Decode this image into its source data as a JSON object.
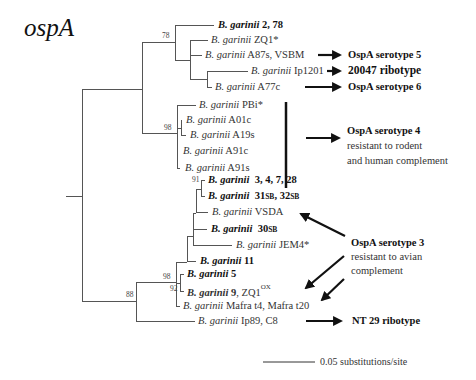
{
  "title": "ospA",
  "taxa": [
    {
      "genus": "B. garinii",
      "strain": "2, 78",
      "bold": true
    },
    {
      "genus": "B. garinii",
      "strain": "ZQ1*",
      "bold": false
    },
    {
      "genus": "B. garinii",
      "strain": "A87s, VSBM",
      "bold": false
    },
    {
      "genus": "B. garinii",
      "strain": "Ip1201",
      "bold": false
    },
    {
      "genus": "B. garinii",
      "strain": "A77c",
      "bold": false
    },
    {
      "genus": "B. garinii",
      "strain": "PBi*",
      "bold": false
    },
    {
      "genus": "B. garinii",
      "strain": "A01c",
      "bold": false
    },
    {
      "genus": "B. garinii",
      "strain": "A19s",
      "bold": false
    },
    {
      "genus": "B. garinii",
      "strain": "A91c",
      "bold": false
    },
    {
      "genus": "B. garinii",
      "strain": "A91s",
      "bold": false
    },
    {
      "genus": "B. garinii",
      "strain": "3, 4, 7, 28",
      "bold": true
    },
    {
      "genus": "B. garinii",
      "strain_a": "31",
      "sub_a": "SB",
      "sep": ", ",
      "strain_b": "32",
      "sub_b": "SB",
      "bold": true
    },
    {
      "genus": "B. garinii",
      "strain": "VSDA",
      "bold": false
    },
    {
      "genus": "B. garinii",
      "strain_a": "30",
      "sub_a": "SB",
      "bold": true
    },
    {
      "genus": "B. garinii",
      "strain": "JEM4*",
      "bold": false
    },
    {
      "genus": "B. garinii",
      "strain": "11",
      "bold": true
    },
    {
      "genus": "B. garinii",
      "strain": "5",
      "bold": true
    },
    {
      "genus": "B. garinii",
      "strain": "9",
      "extra": ", ZQ1",
      "sup": "OX",
      "bold": true
    },
    {
      "genus": "B. garinii",
      "strain": "Mafra t4, Mafra t20",
      "bold": false
    },
    {
      "genus": "B. garinii",
      "strain": "Ip89, C8",
      "bold": false
    }
  ],
  "bootstrap": {
    "n78": "78",
    "n98_upper": "98",
    "n91": "91",
    "n98_lower": "98",
    "n92": "92",
    "n88": "88"
  },
  "annotations": {
    "serotype5": {
      "heading": "OspA serotype 5"
    },
    "ribotype20047": {
      "heading": "20047 ribotype"
    },
    "serotype6": {
      "heading": "OspA serotype 6"
    },
    "serotype4": {
      "heading": "OspA serotype 4",
      "line1": "resistant to rodent",
      "line2": "and human complement"
    },
    "serotype3": {
      "heading": "OspA serotype 3",
      "line1": "resistant to avian",
      "line2": "complement"
    },
    "nt29": {
      "heading": "NT 29 ribotype"
    }
  },
  "scale_bar": {
    "label": "0.05 substitutions/site",
    "value": 0.05
  }
}
